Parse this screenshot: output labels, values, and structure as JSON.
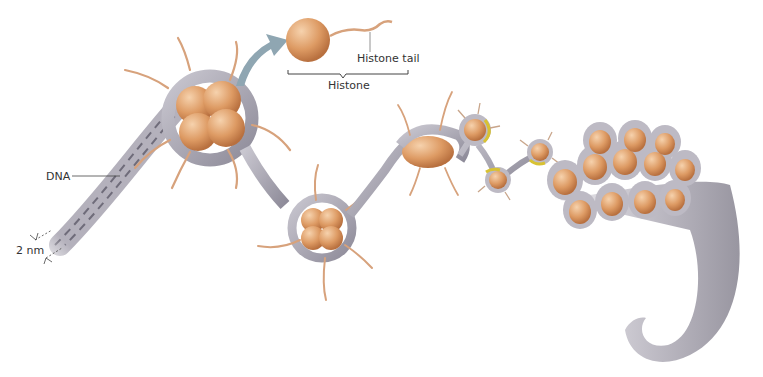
{
  "labels": {
    "histone_tail": "Histone tail",
    "histone": "Histone",
    "dna": "DNA",
    "width": "2 nm"
  },
  "colors": {
    "histone": "#d9935e",
    "histone_light": "#f2c69b",
    "dna": "#a9a7b3",
    "dna_dark": "#6f6c7a",
    "tail": "#d7a27c",
    "linker_yellow": "#d8c232",
    "arrow": "#8fa6b2"
  }
}
